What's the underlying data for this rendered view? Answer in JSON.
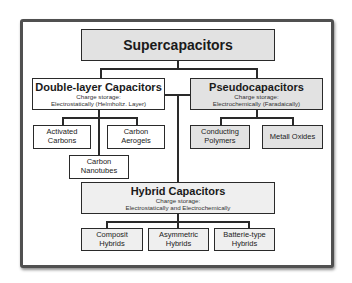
{
  "diagram": {
    "root": {
      "label": "Supercapacitors"
    },
    "double_layer": {
      "label": "Double-layer Capacitors",
      "storage_label": "Charge storage:",
      "storage_value": "Electrostatically (Helmholtz. Layer)",
      "children": [
        "Activated Carbons",
        "Carbon Aerogels",
        "Carbon Nanotubes"
      ]
    },
    "pseudo": {
      "label": "Pseudocapacitors",
      "storage_label": "Charge storage:",
      "storage_value": "Electrochemically  (Faradaically)",
      "children": [
        "Conducting Polymers",
        "Metall Oxides"
      ]
    },
    "hybrid": {
      "label": "Hybrid Capacitors",
      "storage_label": "Charge storage:",
      "storage_value": "Electrostatically and Electrochemically",
      "children": [
        "Composit Hybrids",
        "Asymmetric Hybrids",
        "Batterie-type Hybrids"
      ]
    },
    "colors": {
      "box_border": "#2a2a2a",
      "gray_fill": "#e2e2e2",
      "light_fill": "#efefef",
      "frame_border": "#505050"
    }
  }
}
